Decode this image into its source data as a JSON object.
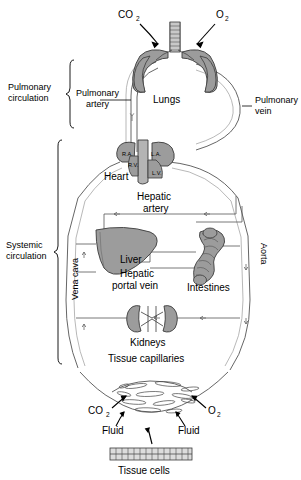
{
  "diagram": {
    "colors": {
      "organ_fill": "#9c9c9c",
      "organ_stroke": "#3a3a3a",
      "vessel_stroke": "#4a4a4a",
      "vessel_fill": "#ffffff",
      "heart_fill": "#9c9c9c",
      "text": "#000000",
      "background": "#ffffff"
    },
    "brackets": [
      {
        "id": "pulmonary",
        "label": "Pulmonary\ncirculation",
        "line1": "Pulmonary",
        "line2": "circulation"
      },
      {
        "id": "systemic",
        "label": "Systemic\ncirculation",
        "line1": "Systemic",
        "line2": "circulation"
      }
    ],
    "vessel_labels": [
      {
        "id": "pulmonary-artery",
        "line1": "Pulmonary",
        "line2": "artery"
      },
      {
        "id": "pulmonary-vein",
        "line1": "Pulmonary",
        "line2": "vein"
      },
      {
        "id": "hepatic-artery",
        "line1": "Hepatic",
        "line2": "artery"
      },
      {
        "id": "hepatic-portal-vein",
        "line1": "Hepatic",
        "line2": "portal vein"
      },
      {
        "id": "vena-cava",
        "text": "Vena cava"
      },
      {
        "id": "aorta",
        "text": "Aorta"
      }
    ],
    "organs": [
      {
        "id": "lungs",
        "label": "Lungs"
      },
      {
        "id": "heart",
        "label": "Heart"
      },
      {
        "id": "liver",
        "label": "Liver"
      },
      {
        "id": "intestines",
        "label": "Intestines"
      },
      {
        "id": "kidneys",
        "label": "Kidneys"
      },
      {
        "id": "tissue-capillaries",
        "label": "Tissue capillaries"
      },
      {
        "id": "tissue-cells",
        "label": "Tissue cells"
      }
    ],
    "heart_chambers": [
      {
        "id": "right-atrium",
        "label": "R.A."
      },
      {
        "id": "right-ventricle",
        "label": "R.V."
      },
      {
        "id": "left-atrium",
        "label": "L.A."
      },
      {
        "id": "left-ventricle",
        "label": "L.V."
      }
    ],
    "gas_labels": [
      {
        "id": "lung-co2",
        "base": "CO",
        "sub": "2"
      },
      {
        "id": "lung-o2",
        "base": "O",
        "sub": "2"
      },
      {
        "id": "tissue-co2",
        "base": "CO",
        "sub": "2"
      },
      {
        "id": "tissue-o2",
        "base": "O",
        "sub": "2"
      }
    ],
    "fluid_labels": [
      {
        "id": "fluid-left",
        "text": "Fluid"
      },
      {
        "id": "fluid-right",
        "text": "Fluid"
      }
    ]
  }
}
